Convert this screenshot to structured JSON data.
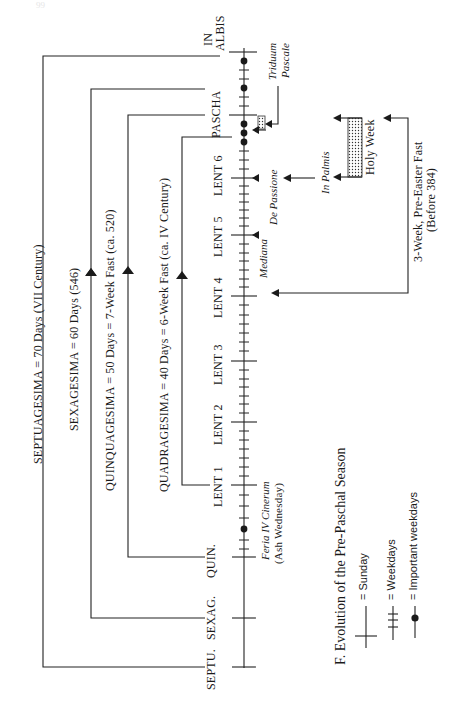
{
  "page": {
    "number_faint": "99"
  },
  "caption": "F.  Evolution of the Pre-Paschal Season",
  "periods": [
    {
      "label": "SEPTUAGESIMA = 70 Days (VII Century)",
      "start": "SEPTU."
    },
    {
      "label": "SEXAGESIMA = 60 Days (546)",
      "start": "SEXAG."
    },
    {
      "label": "QUINQUAGESIMA = 50 Days = 7-Week Fast (ca. 520)",
      "start": "QUIN."
    },
    {
      "label": "QUADRAGESIMA = 40 Days = 6-Week Fast (ca. IV Century)",
      "start": "LENT 1"
    }
  ],
  "sundays": [
    {
      "label": "SEPTU."
    },
    {
      "label": "SEXAG."
    },
    {
      "label": "QUIN."
    },
    {
      "label": "LENT 1"
    },
    {
      "label": "LENT 2"
    },
    {
      "label": "LENT 3"
    },
    {
      "label": "LENT 4"
    },
    {
      "label": "LENT 5"
    },
    {
      "label": "LENT 6"
    },
    {
      "label": "PASCHA"
    },
    {
      "label": "IN",
      "label2": "ALBIS"
    }
  ],
  "annotations": {
    "ash_wednesday": {
      "line1": "Feria IV Cinerum",
      "line2": "(Ash Wednesday)"
    },
    "mediana": "Mediana",
    "de_passione": "De Passione",
    "in_palmis": "In Palmis",
    "holy_week": "Holy Week",
    "triduum": {
      "line1": "Triduum",
      "line2": "Pascale"
    },
    "three_week": {
      "line1": "3-Week, Pre-Easter Fast",
      "line2": "(Before 384)"
    }
  },
  "legend": [
    {
      "symbol": "sunday",
      "text": "= Sunday"
    },
    {
      "symbol": "weekdays",
      "text": "= Weekdays"
    },
    {
      "symbol": "important",
      "text": "= Important weekdays"
    }
  ]
}
